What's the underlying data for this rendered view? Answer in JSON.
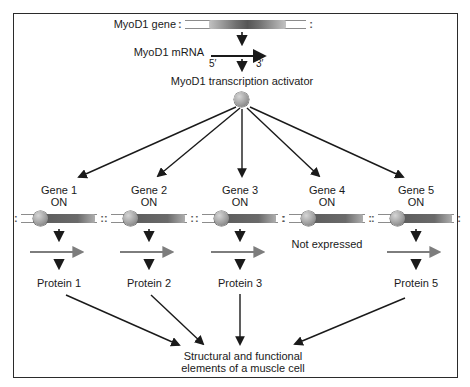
{
  "figure": {
    "top": {
      "gene_label": "MyoD1 gene",
      "mrna_label": "MyoD1 mRNA",
      "five_prime": "5′",
      "three_prime": "3′",
      "activator_label": "MyoD1 transcription activator",
      "dna_end_mark": ":"
    },
    "genes": [
      {
        "name": "Gene 1",
        "state": "ON",
        "protein": "Protein 1"
      },
      {
        "name": "Gene 2",
        "state": "ON",
        "protein": "Protein 2"
      },
      {
        "name": "Gene 3",
        "state": "ON",
        "protein": "Protein 3"
      },
      {
        "name": "Gene 4",
        "state": "ON",
        "note": "Not expressed"
      },
      {
        "name": "Gene 5",
        "state": "ON",
        "protein": "Protein 5"
      }
    ],
    "outcome_line1": "Structural and functional",
    "outcome_line2": "elements of a muscle cell",
    "colors": {
      "ink": "#1a1a1a",
      "arrow_gray": "#7d7d7d",
      "dna_dark": "#5e5e5e",
      "dna_light": "#b8b8b8",
      "sphere_light": "#d6d6d6",
      "sphere_dark": "#6d6d6d"
    }
  }
}
